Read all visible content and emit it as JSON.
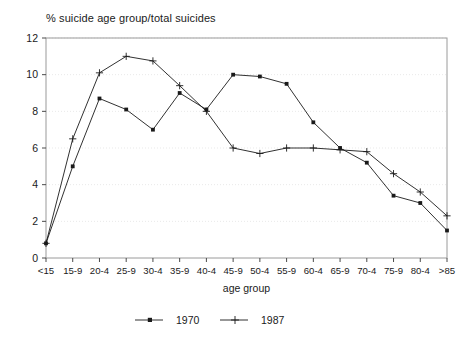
{
  "chart_data": {
    "type": "line",
    "title": "% suicide age group/total suicides",
    "xlabel": "age group",
    "ylabel": "",
    "categories": [
      "<15",
      "15-9",
      "20-4",
      "25-9",
      "30-4",
      "35-9",
      "40-4",
      "45-9",
      "50-4",
      "55-9",
      "60-4",
      "65-9",
      "70-4",
      "75-9",
      "80-4",
      ">85"
    ],
    "yticks": [
      0,
      2,
      4,
      6,
      8,
      10,
      12
    ],
    "ylim": [
      0,
      12
    ],
    "grid": true,
    "legend_position": "bottom",
    "series": [
      {
        "name": "1970",
        "marker": "filled-square",
        "color": "#1a1a1a",
        "values": [
          0.8,
          5.0,
          8.7,
          8.1,
          7.0,
          9.0,
          8.1,
          10.0,
          9.9,
          9.5,
          7.4,
          6.0,
          5.2,
          3.4,
          3.0,
          1.5
        ]
      },
      {
        "name": "1987",
        "marker": "plus",
        "color": "#1a1a1a",
        "values": [
          0.8,
          6.5,
          10.1,
          11.0,
          10.75,
          9.4,
          8.0,
          6.0,
          5.7,
          6.0,
          6.0,
          5.9,
          5.8,
          4.6,
          3.6,
          2.3
        ]
      }
    ]
  },
  "legend": {
    "items": [
      {
        "label": "1970"
      },
      {
        "label": "1987"
      }
    ]
  }
}
